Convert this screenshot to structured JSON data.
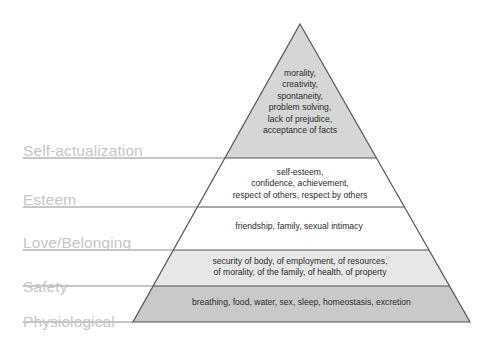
{
  "diagram": {
    "apex": {
      "x": 300,
      "y": 24
    },
    "base_left_x": 133,
    "base_right_x": 470,
    "base_y": 322,
    "label_underline_start_x": 23,
    "colors": {
      "tier_self_actualization": "#d6d6d6",
      "tier_esteem": "#ffffff",
      "tier_love": "#ffffff",
      "tier_safety": "#e7e7e7",
      "tier_physiological": "#c9c9c9",
      "outline": "#555555",
      "divider": "#555555",
      "label_text": "#c6c6c6",
      "label_rule": "#8e8e8e",
      "body_text": "#2a2a2a",
      "background": "#ffffff"
    },
    "tiers": [
      {
        "id": "self-actualization",
        "label": "Self-actualization",
        "content": "morality,\ncreativity,\nspontaneity,\nproblem solving,\nlack of prejudice,\nacceptance of facts",
        "top_y": 24,
        "bottom_y": 158,
        "fill": "#d6d6d6",
        "label_y": 142,
        "rule_y": 158,
        "text_top": 68,
        "text_left": 238,
        "text_width": 124
      },
      {
        "id": "esteem",
        "label": "Esteem",
        "content": "self-esteem,\nconfidence, achievement,\nrespect of others, respect by others",
        "top_y": 158,
        "bottom_y": 207,
        "fill": "#ffffff",
        "label_y": 191,
        "rule_y": 207,
        "text_top": 167,
        "text_left": 192,
        "text_width": 216
      },
      {
        "id": "love-belonging",
        "label": "Love/Belonging",
        "content": "friendship, family, sexual intimacy",
        "top_y": 207,
        "bottom_y": 250,
        "fill": "#ffffff",
        "label_y": 234,
        "rule_y": 250,
        "text_top": 221,
        "text_left": 168,
        "text_width": 262
      },
      {
        "id": "safety",
        "label": "Safety",
        "content": "security of body, of employment, of resources,\nof morality, of the family, of health, of property",
        "top_y": 250,
        "bottom_y": 286,
        "fill": "#e7e7e7",
        "label_y": 278,
        "rule_y": 286,
        "text_top": 256,
        "text_left": 148,
        "text_width": 304
      },
      {
        "id": "physiological",
        "label": "Physiological",
        "content": "breathing, food, water, sex, sleep, homeostasis, excretion",
        "top_y": 286,
        "bottom_y": 322,
        "fill": "#c9c9c9",
        "label_y": 313,
        "rule_y": 322,
        "text_top": 297,
        "text_left": 133,
        "text_width": 337
      }
    ]
  }
}
